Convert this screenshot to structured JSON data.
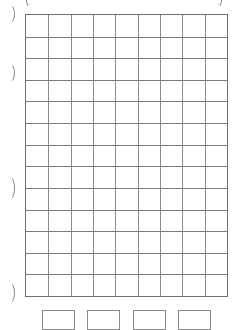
{
  "worksheet": {
    "grid": {
      "columns": 9,
      "rows": 13,
      "line_color": "#7a7a7a",
      "border_color": "#6f6f6f"
    },
    "margin_marks": {
      "left_brackets": [
        {
          "top": 4,
          "height": 18
        },
        {
          "top": 63,
          "height": 18
        },
        {
          "top": 176,
          "height": 22
        },
        {
          "top": 282,
          "height": 20
        }
      ],
      "top_brackets": [
        "left-open",
        "right-close"
      ]
    },
    "answer_boxes": [
      {
        "left": 42
      },
      {
        "left": 87
      },
      {
        "left": 133
      },
      {
        "left": 178
      }
    ]
  }
}
